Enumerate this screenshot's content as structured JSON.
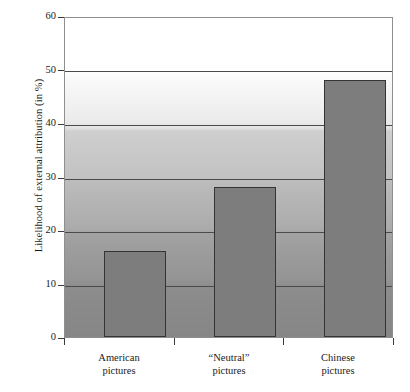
{
  "chart_data": {
    "type": "bar",
    "title": "",
    "xlabel": "",
    "ylabel": "Likelihood of external attribution (in %)",
    "categories": [
      "American pictures",
      "\"Neutral\" pictures",
      "Chinese pictures"
    ],
    "category_lines": [
      [
        "American",
        "pictures"
      ],
      [
        "“Neutral”",
        "pictures"
      ],
      [
        "Chinese",
        "pictures"
      ]
    ],
    "values": [
      16,
      28,
      48
    ],
    "ylim": [
      0,
      60
    ],
    "yticks": [
      0,
      10,
      20,
      30,
      40,
      50,
      60
    ],
    "ytick_labels": [
      "0",
      "10",
      "20",
      "30",
      "40",
      "50",
      "60"
    ],
    "grid": true,
    "grid_axis": "y",
    "legend": "none",
    "bar_color": "#7d7d7d",
    "bar_edge_color": "#343434",
    "gridline_color": "#4a4a4a",
    "frame_color": "#8f8f8f",
    "text_color": "#1b1b1b",
    "plot_background": "white-to-gray vertical gradient"
  }
}
